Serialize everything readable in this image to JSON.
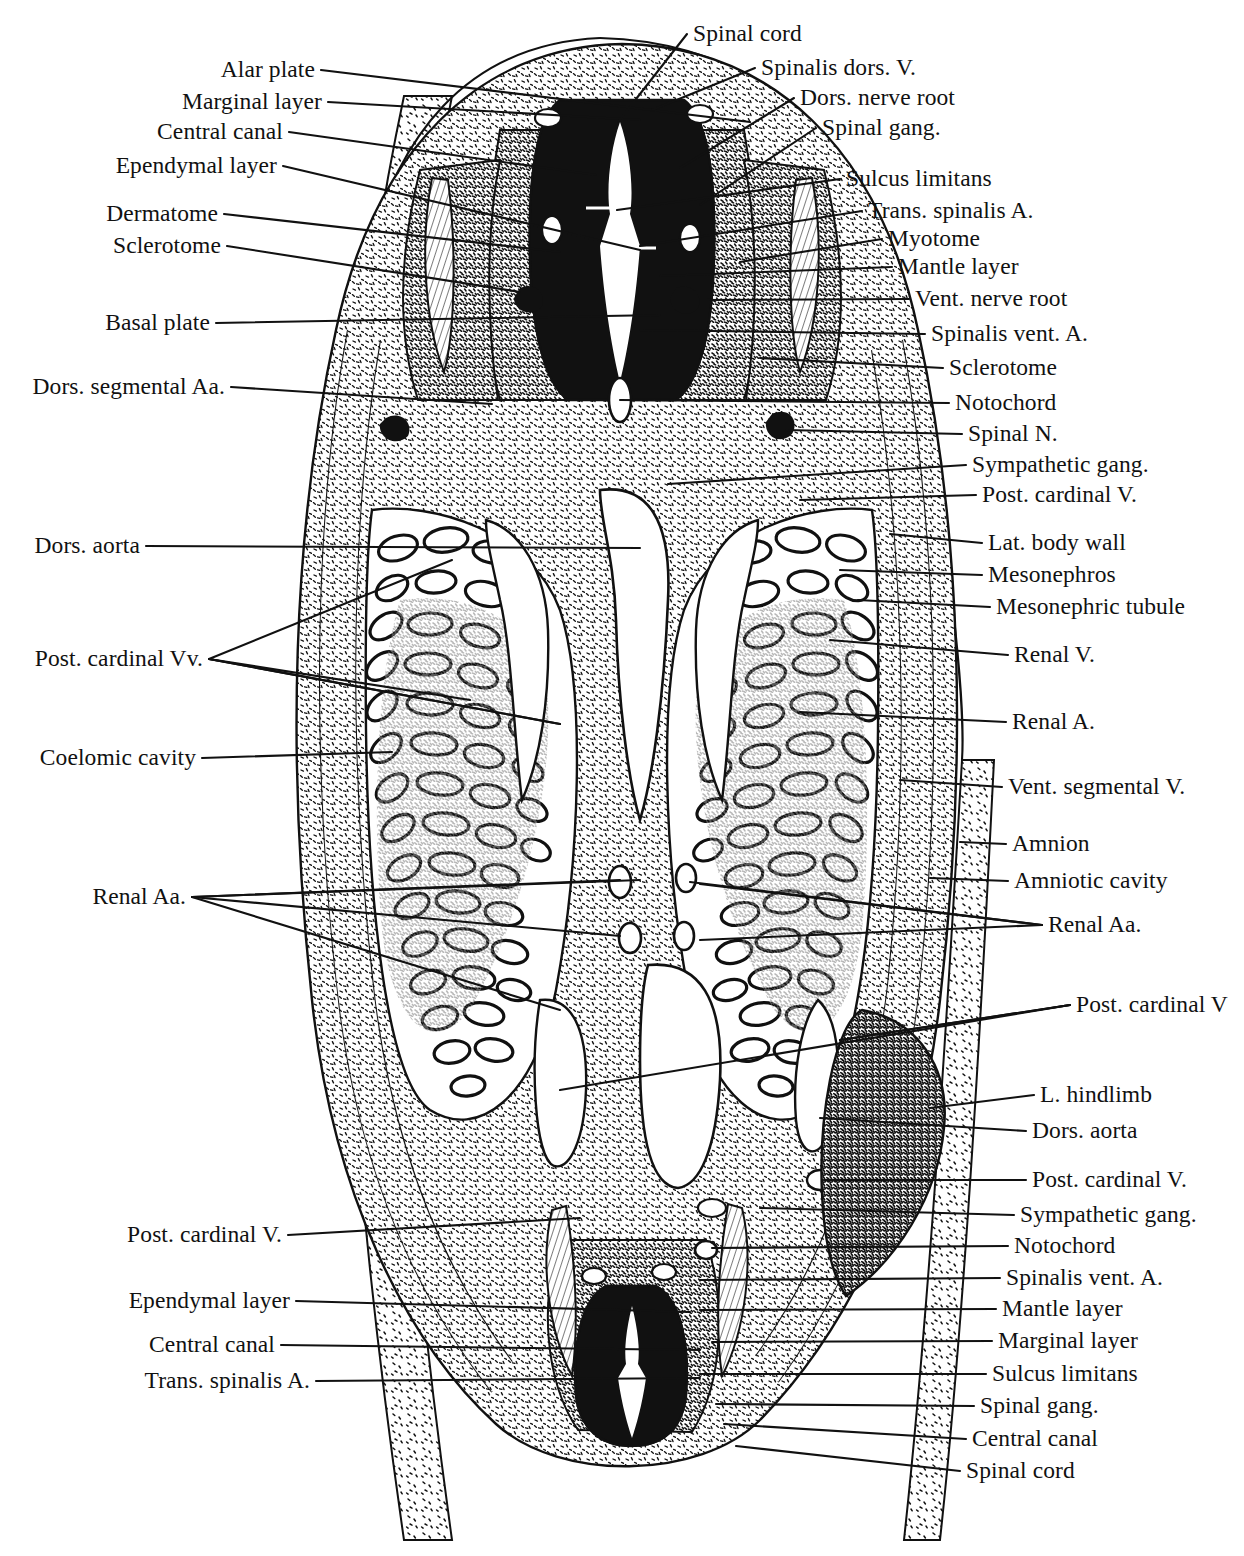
{
  "figure": {
    "background_color": "#ffffff",
    "ink_color": "#111111",
    "width": 1244,
    "height": 1556
  },
  "labels_left": [
    {
      "text": "Alar plate",
      "x": 315,
      "y": 70,
      "lx": 750,
      "ly": 122
    },
    {
      "text": "Marginal layer",
      "x": 322,
      "y": 102,
      "lx": 640,
      "ly": 120
    },
    {
      "text": "Central canal",
      "x": 283,
      "y": 132,
      "lx": 596,
      "ly": 175
    },
    {
      "text": "Ependymal layer",
      "x": 277,
      "y": 166,
      "lx": 640,
      "ly": 250
    },
    {
      "text": "Dermatome",
      "x": 218,
      "y": 214,
      "lx": 560,
      "ly": 252
    },
    {
      "text": "Sclerotome",
      "x": 221,
      "y": 246,
      "lx": 520,
      "ly": 292
    },
    {
      "text": "Basal plate",
      "x": 210,
      "y": 323,
      "lx": 660,
      "ly": 315
    },
    {
      "text": "Dors. segmental Aa.",
      "x": 225,
      "y": 387,
      "lx": 492,
      "ly": 404
    },
    {
      "text": "Dors. aorta",
      "x": 140,
      "y": 546,
      "lx": 640,
      "ly": 548
    },
    {
      "text": "Post. cardinal Vv.",
      "x": 203,
      "y": 659,
      "lx": 560,
      "ly": 724
    },
    {
      "text": "Coelomic cavity",
      "x": 196,
      "y": 758,
      "lx": 392,
      "ly": 752
    },
    {
      "text": "Renal Aa.",
      "x": 186,
      "y": 897,
      "lx": 620,
      "ly": 880
    },
    {
      "text": "Post. cardinal V.",
      "x": 282,
      "y": 1235,
      "lx": 580,
      "ly": 1218
    },
    {
      "text": "Ependymal layer",
      "x": 290,
      "y": 1301,
      "lx": 690,
      "ly": 1312
    },
    {
      "text": "Central canal",
      "x": 275,
      "y": 1345,
      "lx": 700,
      "ly": 1350
    },
    {
      "text": "Trans. spinalis A.",
      "x": 310,
      "y": 1381,
      "lx": 700,
      "ly": 1378
    }
  ],
  "labels_right": [
    {
      "text": "Spinal cord",
      "x": 693,
      "y": 34,
      "lx": 618,
      "ly": 122
    },
    {
      "text": "Spinalis dors. V.",
      "x": 761,
      "y": 68,
      "lx": 652,
      "ly": 110
    },
    {
      "text": "Dors. nerve root",
      "x": 800,
      "y": 98,
      "lx": 680,
      "ly": 168
    },
    {
      "text": "Spinal gang.",
      "x": 822,
      "y": 128,
      "lx": 700,
      "ly": 205
    },
    {
      "text": "Sulcus limitans",
      "x": 846,
      "y": 179,
      "lx": 617,
      "ly": 210
    },
    {
      "text": "Trans. spinalis A.",
      "x": 868,
      "y": 211,
      "lx": 640,
      "ly": 246
    },
    {
      "text": "Myotome",
      "x": 888,
      "y": 239,
      "lx": 740,
      "ly": 262
    },
    {
      "text": "Mantle layer",
      "x": 898,
      "y": 267,
      "lx": 660,
      "ly": 276
    },
    {
      "text": "Vent. nerve root",
      "x": 915,
      "y": 299,
      "lx": 700,
      "ly": 300
    },
    {
      "text": "Spinalis vent. A.",
      "x": 931,
      "y": 334,
      "lx": 640,
      "ly": 330
    },
    {
      "text": "Sclerotome",
      "x": 949,
      "y": 368,
      "lx": 760,
      "ly": 358
    },
    {
      "text": "Notochord",
      "x": 955,
      "y": 403,
      "lx": 620,
      "ly": 400
    },
    {
      "text": "Spinal N.",
      "x": 968,
      "y": 434,
      "lx": 786,
      "ly": 430
    },
    {
      "text": "Sympathetic gang.",
      "x": 972,
      "y": 465,
      "lx": 668,
      "ly": 484
    },
    {
      "text": "Post. cardinal V.",
      "x": 982,
      "y": 495,
      "lx": 800,
      "ly": 500
    },
    {
      "text": "Lat. body wall",
      "x": 988,
      "y": 543,
      "lx": 890,
      "ly": 534
    },
    {
      "text": "Mesonephros",
      "x": 988,
      "y": 575,
      "lx": 840,
      "ly": 570
    },
    {
      "text": "Mesonephric tubule",
      "x": 996,
      "y": 607,
      "lx": 858,
      "ly": 600
    },
    {
      "text": "Renal V.",
      "x": 1014,
      "y": 655,
      "lx": 830,
      "ly": 640
    },
    {
      "text": "Renal A.",
      "x": 1012,
      "y": 722,
      "lx": 800,
      "ly": 712
    },
    {
      "text": "Vent. segmental V.",
      "x": 1008,
      "y": 787,
      "lx": 900,
      "ly": 780
    },
    {
      "text": "Amnion",
      "x": 1012,
      "y": 844,
      "lx": 960,
      "ly": 842
    },
    {
      "text": "Amniotic cavity",
      "x": 1014,
      "y": 881,
      "lx": 930,
      "ly": 878
    },
    {
      "text": "Renal Aa.",
      "x": 1048,
      "y": 925,
      "lx": 700,
      "ly": 884
    },
    {
      "text": "Post. cardinal V",
      "x": 1076,
      "y": 1005,
      "lx": 840,
      "ly": 1040
    },
    {
      "text": "L. hindlimb",
      "x": 1040,
      "y": 1095,
      "lx": 930,
      "ly": 1108
    },
    {
      "text": "Dors. aorta",
      "x": 1032,
      "y": 1131,
      "lx": 820,
      "ly": 1118
    },
    {
      "text": "Post. cardinal V.",
      "x": 1032,
      "y": 1180,
      "lx": 824,
      "ly": 1180
    },
    {
      "text": "Sympathetic gang.",
      "x": 1020,
      "y": 1215,
      "lx": 760,
      "ly": 1208
    },
    {
      "text": "Notochord",
      "x": 1014,
      "y": 1246,
      "lx": 712,
      "ly": 1248
    },
    {
      "text": "Spinalis vent. A.",
      "x": 1006,
      "y": 1278,
      "lx": 700,
      "ly": 1280
    },
    {
      "text": "Mantle layer",
      "x": 1002,
      "y": 1309,
      "lx": 700,
      "ly": 1310
    },
    {
      "text": "Marginal layer",
      "x": 998,
      "y": 1341,
      "lx": 712,
      "ly": 1342
    },
    {
      "text": "Sulcus limitans",
      "x": 992,
      "y": 1374,
      "lx": 700,
      "ly": 1374
    },
    {
      "text": "Spinal gang.",
      "x": 980,
      "y": 1406,
      "lx": 716,
      "ly": 1404
    },
    {
      "text": "Central canal",
      "x": 972,
      "y": 1439,
      "lx": 724,
      "ly": 1424
    },
    {
      "text": "Spinal cord",
      "x": 966,
      "y": 1471,
      "lx": 736,
      "ly": 1446
    }
  ]
}
